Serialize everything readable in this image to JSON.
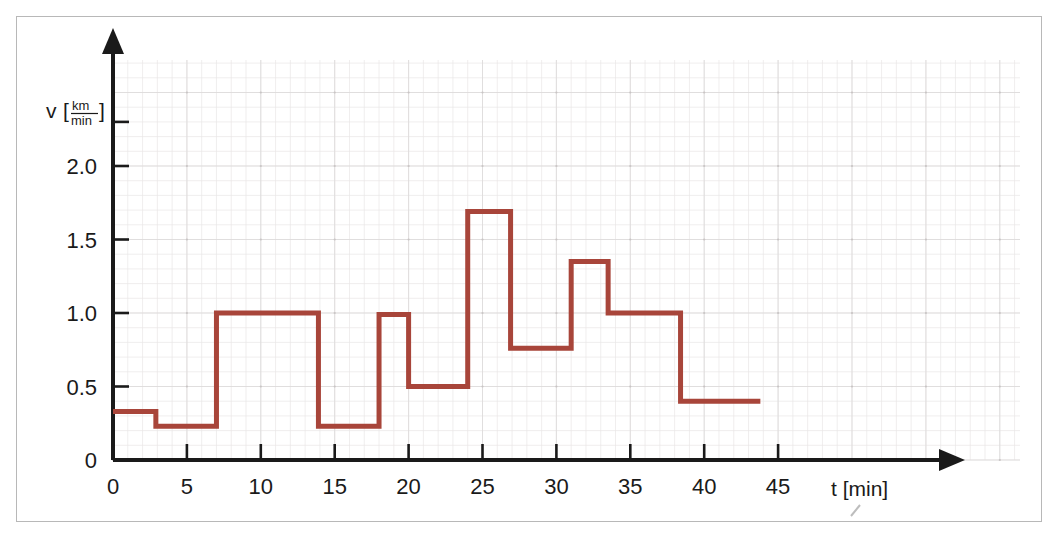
{
  "figure": {
    "background_color": "#ffffff",
    "frame_color": "#b8b8b8",
    "axis_color": "#1a1a1a",
    "grid_color": "#e9e7e7"
  },
  "chart_data": {
    "type": "line",
    "subtype": "step-post",
    "title": "",
    "xlabel": "t [min]",
    "ylabel": "v [km/min]",
    "ylabel_symbol": "v",
    "ylabel_unit_numerator": "km",
    "ylabel_unit_denominator": "min",
    "xlabel_symbol": "t",
    "xlabel_unit": "min",
    "grid": true,
    "legend": false,
    "line_color": "#a8453a",
    "xlim": [
      0,
      47
    ],
    "ylim": [
      0,
      2.35
    ],
    "xticks": [
      0,
      5,
      10,
      15,
      20,
      25,
      30,
      35,
      40,
      45
    ],
    "xticklabels": [
      "0",
      "5",
      "10",
      "15",
      "20",
      "25",
      "30",
      "35",
      "40",
      "45"
    ],
    "yticks": [
      0,
      0.5,
      1.0,
      1.5,
      2.0,
      2.3
    ],
    "yticklabels": [
      "0",
      "0.5",
      "1.0",
      "1.5",
      "2.0",
      ""
    ],
    "x_minor_step": 1,
    "y_minor_step": 0.1,
    "segments": [
      {
        "t_start": 0,
        "t_end": 2.9,
        "v": 0.33
      },
      {
        "t_start": 2.9,
        "t_end": 7.0,
        "v": 0.23
      },
      {
        "t_start": 7.0,
        "t_end": 13.9,
        "v": 1.0
      },
      {
        "t_start": 13.9,
        "t_end": 18.0,
        "v": 0.23
      },
      {
        "t_start": 18.0,
        "t_end": 20.0,
        "v": 0.99
      },
      {
        "t_start": 20.0,
        "t_end": 24.0,
        "v": 0.5
      },
      {
        "t_start": 24.0,
        "t_end": 26.9,
        "v": 1.69
      },
      {
        "t_start": 26.9,
        "t_end": 31.0,
        "v": 0.76
      },
      {
        "t_start": 31.0,
        "t_end": 33.5,
        "v": 1.35
      },
      {
        "t_start": 33.5,
        "t_end": 38.4,
        "v": 1.0
      },
      {
        "t_start": 38.4,
        "t_end": 43.8,
        "v": 0.4
      }
    ],
    "x": [
      0,
      2.9,
      2.9,
      7.0,
      7.0,
      13.9,
      13.9,
      18.0,
      18.0,
      20.0,
      20.0,
      24.0,
      24.0,
      26.9,
      26.9,
      31.0,
      31.0,
      33.5,
      33.5,
      38.4,
      38.4,
      43.8
    ],
    "y": [
      0.33,
      0.33,
      0.23,
      0.23,
      1.0,
      1.0,
      0.23,
      0.23,
      0.99,
      0.99,
      0.5,
      0.5,
      1.69,
      1.69,
      0.76,
      0.76,
      1.35,
      1.35,
      1.0,
      1.0,
      0.4,
      0.4
    ]
  }
}
